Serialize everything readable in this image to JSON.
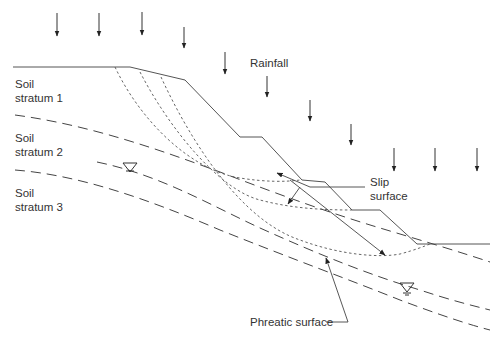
{
  "diagram": {
    "labels": {
      "stratum1_line1": "Soil",
      "stratum1_line2": "stratum 1",
      "stratum2_line1": "Soil",
      "stratum2_line2": "stratum 2",
      "stratum3_line1": "Soil",
      "stratum3_line2": "stratum 3",
      "rainfall": "Rainfall",
      "slip_line1": "Slip",
      "slip_line2": "surface",
      "phreatic": "Phreatic surface"
    },
    "elements": {
      "rainfall_arrows": 10,
      "slip_surfaces": 3,
      "stratum_boundaries": 2,
      "phreatic_lines": 2,
      "water_table_symbols": 2
    },
    "colors": {
      "line": "#444444",
      "text": "#333333",
      "background": "#ffffff"
    }
  }
}
